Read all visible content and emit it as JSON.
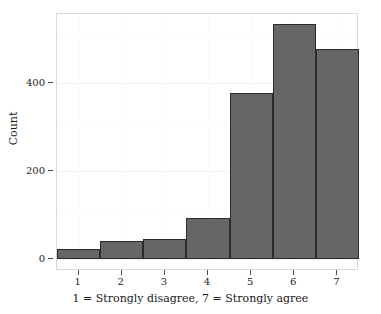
{
  "chart_data": {
    "type": "bar",
    "title": "",
    "subtitle": "",
    "xlabel": "1 = Strongly disagree, 7 = Strongly agree",
    "ylabel": "Count",
    "categories": [
      "1",
      "2",
      "3",
      "4",
      "5",
      "6",
      "7"
    ],
    "values": [
      23,
      41,
      46,
      93,
      377,
      533,
      478
    ],
    "series": [
      {
        "name": "Count",
        "values": [
          23,
          41,
          46,
          93,
          377,
          533,
          478
        ]
      }
    ],
    "xlim": [
      0.5,
      7.5
    ],
    "ylim": [
      0,
      545
    ],
    "ytick_labels": [
      "0",
      "200",
      "400"
    ],
    "ytick_values": [
      0,
      200,
      400
    ],
    "xtick_labels": [
      "1",
      "2",
      "3",
      "4",
      "5",
      "6",
      "7"
    ],
    "xtick_values": [
      1,
      2,
      3,
      4,
      5,
      6,
      7
    ],
    "grid": true,
    "legend": null,
    "legend_position": "none",
    "bar_fill_color": "#666666",
    "bar_border_color": "#2b2b2b",
    "panel_border_color": "#d9d9d9",
    "gridline_color": "#f2f2f2",
    "background_color": "#ffffff",
    "text_color": "#1a1a1a",
    "annotations": []
  }
}
